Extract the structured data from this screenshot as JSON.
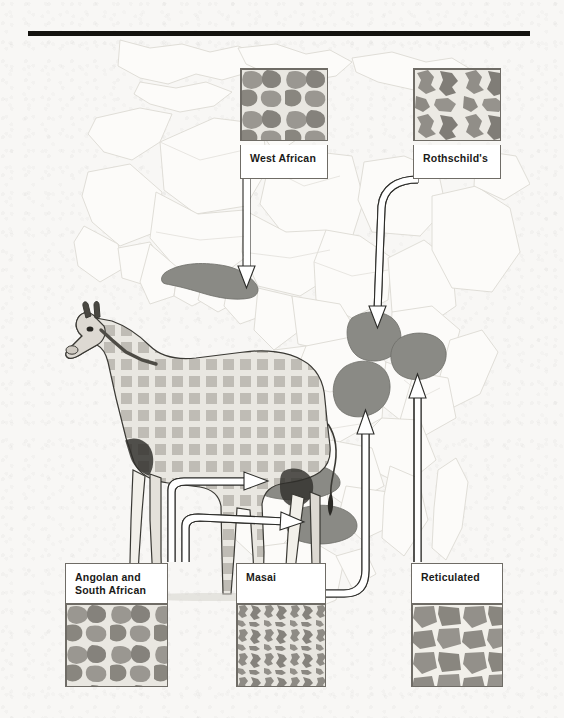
{
  "figure": {
    "title_rule": true,
    "continent": "Africa"
  },
  "colors": {
    "paper": "#f8f7f5",
    "rule": "#14130f",
    "map_land": "#fbfaf8",
    "map_border": "#d8d6d0",
    "range_fill": "#8a8a85",
    "range_stroke": "#6d6d68",
    "connector_fill": "#ffffff",
    "connector_stroke": "#2b2b28",
    "card_border": "#6f6c66",
    "label_text": "#1a1a18",
    "coat_spot": "#9a9791",
    "coat_spot_dark": "#82807a",
    "coat_gap": "#e8e6e0"
  },
  "subspecies": [
    {
      "id": "west-african",
      "label": "West African",
      "pattern": "blotchy-rounded",
      "label_position": "below",
      "swatch": {
        "x": 240,
        "y": 68,
        "w": 88,
        "h": 73
      },
      "card": {
        "x": 240,
        "y": 141,
        "w": 88,
        "h": 34
      }
    },
    {
      "id": "rothschilds",
      "label": "Rothschild's",
      "pattern": "jagged-large",
      "label_position": "below",
      "swatch": {
        "x": 413,
        "y": 68,
        "w": 88,
        "h": 73
      },
      "card": {
        "x": 413,
        "y": 141,
        "w": 88,
        "h": 34
      }
    },
    {
      "id": "angolan-south-african",
      "label": "Angolan and\nSouth African",
      "pattern": "blotchy-rounded",
      "label_position": "above",
      "card": {
        "x": 65,
        "y": 563,
        "w": 103,
        "h": 40
      },
      "swatch": {
        "x": 65,
        "y": 603,
        "w": 103,
        "h": 84
      }
    },
    {
      "id": "masai",
      "label": "Masai",
      "pattern": "vine-leaf-fine",
      "label_position": "above",
      "card": {
        "x": 236,
        "y": 563,
        "w": 90,
        "h": 40
      },
      "swatch": {
        "x": 236,
        "y": 603,
        "w": 90,
        "h": 84
      }
    },
    {
      "id": "reticulated",
      "label": "Reticulated",
      "pattern": "polygonal-net",
      "label_position": "above",
      "card": {
        "x": 411,
        "y": 563,
        "w": 92,
        "h": 40
      },
      "swatch": {
        "x": 411,
        "y": 603,
        "w": 92,
        "h": 84
      }
    }
  ],
  "ranges": [
    {
      "id": "range-west-african",
      "subspecies": "west-african"
    },
    {
      "id": "range-rothschilds",
      "subspecies": "rothschilds"
    },
    {
      "id": "range-reticulated",
      "subspecies": "reticulated"
    },
    {
      "id": "range-masai",
      "subspecies": "masai"
    },
    {
      "id": "range-angolan",
      "subspecies": "angolan-south-african"
    },
    {
      "id": "range-south-african",
      "subspecies": "angolan-south-african"
    }
  ],
  "illustration": {
    "id": "giraffe-illustration",
    "description": "standing giraffe side view"
  }
}
